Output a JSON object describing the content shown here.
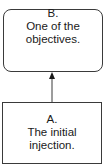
{
  "diagram": {
    "nodes": [
      {
        "id": "B",
        "label": "B.",
        "text_lines": [
          "One of the",
          "objectives."
        ],
        "shape": "rounded-rectangle"
      },
      {
        "id": "A",
        "label": "A.",
        "text_lines": [
          "The initial",
          "injection."
        ],
        "shape": "rectangle"
      }
    ],
    "edges": [
      {
        "from": "A",
        "to": "B",
        "type": "arrow"
      }
    ]
  }
}
